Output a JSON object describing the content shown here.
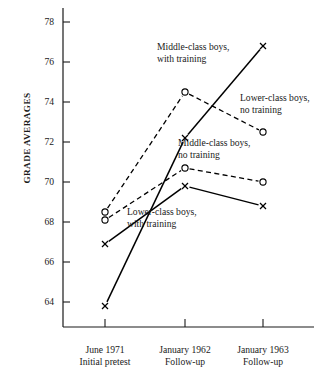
{
  "chart_data": {
    "type": "line",
    "title": "",
    "xlabel": "",
    "ylabel": "GRADE AVERAGES",
    "ylim": [
      62.6,
      78.8
    ],
    "yticks": [
      64,
      66,
      68,
      70,
      72,
      74,
      76,
      78
    ],
    "ytick_labels": [
      "64",
      "66",
      "68",
      "70",
      "72",
      "74",
      "76",
      "78"
    ],
    "grid": false,
    "legend_position": "inline-annotations",
    "categories": [
      "June 1971 Initial pretest",
      "January 1962 Follow-up",
      "January 1963 Follow-up"
    ],
    "xtick_labels": [
      {
        "line1": "June 1971",
        "line2": "Initial pretest"
      },
      {
        "line1": "January 1962",
        "line2": "Follow-up"
      },
      {
        "line1": "January 1963",
        "line2": "Follow-up"
      }
    ],
    "series": [
      {
        "name": "Middle-class boys, with training",
        "label_line1": "Middle-class boys,",
        "label_line2": "with training",
        "linestyle": "solid",
        "marker": "x",
        "color": "#000000",
        "values": [
          63.8,
          72.2,
          76.8
        ]
      },
      {
        "name": "Lower-class boys, no training",
        "label_line1": "Lower-class boys,",
        "label_line2": "no training",
        "linestyle": "dashed",
        "marker": "o",
        "color": "#000000",
        "values": [
          68.5,
          74.5,
          72.5
        ]
      },
      {
        "name": "Middle-class boys, no training",
        "label_line1": "Middle-class boys,",
        "label_line2": "no training",
        "linestyle": "dashed",
        "marker": "o",
        "color": "#000000",
        "values": [
          68.1,
          70.7,
          70.0
        ]
      },
      {
        "name": "Lower-class boys, with training",
        "label_line1": "Lower-class boys,",
        "label_line2": "with training",
        "linestyle": "solid",
        "marker": "x",
        "color": "#000000",
        "values": [
          66.9,
          69.8,
          68.8
        ]
      }
    ],
    "axis_color": "#1a1a1a"
  }
}
